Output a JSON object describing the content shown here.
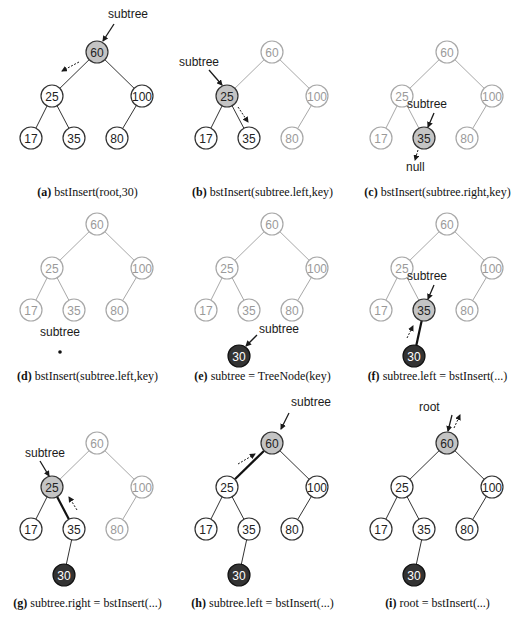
{
  "figure": {
    "colors": {
      "edge_active": "#333333",
      "edge_faded": "#a8a8a8",
      "node_fill": "#ffffff",
      "node_stroke": "#333333",
      "node_stroke_faded": "#a8a8a8",
      "text_faded": "#9a9a9a",
      "highlight_fill": "#c4c4c4",
      "new_node_fill": "#333333",
      "new_node_text": "#ffffff",
      "arrow": "#1a1a1a"
    },
    "tree": {
      "nodes": [
        {
          "id": "n60",
          "key": "60",
          "x": 45,
          "y": 52
        },
        {
          "id": "n25",
          "key": "25",
          "x": 0,
          "y": 96
        },
        {
          "id": "n100",
          "key": "100",
          "x": 90,
          "y": 96
        },
        {
          "id": "n17",
          "key": "17",
          "x": -21,
          "y": 138
        },
        {
          "id": "n35",
          "key": "35",
          "x": 22,
          "y": 138
        },
        {
          "id": "n80",
          "key": "80",
          "x": 65,
          "y": 138
        },
        {
          "id": "n30",
          "key": "30",
          "x": 12,
          "y": 184
        }
      ],
      "edges": [
        [
          "n60",
          "n25"
        ],
        [
          "n60",
          "n100"
        ],
        [
          "n25",
          "n17"
        ],
        [
          "n25",
          "n35"
        ],
        [
          "n100",
          "n80"
        ],
        [
          "n35",
          "n30"
        ]
      ]
    },
    "panels": [
      {
        "id": "a",
        "letter": "(a)",
        "caption": "bstInsert(root,30)",
        "ox": 52,
        "oy": 0,
        "capY": 185,
        "faded": [],
        "highlight": [
          "n60"
        ],
        "dark": [],
        "hidden": [
          "n30"
        ],
        "boldEdges": [],
        "labels": [
          {
            "text": "subtree",
            "x": 56,
            "y": 18
          }
        ],
        "arrows": [
          {
            "x1": 62,
            "y1": 24,
            "x2": 51,
            "y2": 41,
            "dashed": false
          },
          {
            "x1": 27,
            "y1": 62,
            "x2": 10,
            "y2": 71,
            "dashed": true
          }
        ]
      },
      {
        "id": "b",
        "letter": "(b)",
        "caption": "bstInsert(subtree.left,key)",
        "ox": 227,
        "oy": 0,
        "capY": 185,
        "faded": [
          "n60",
          "n100",
          "n80"
        ],
        "highlight": [
          "n25"
        ],
        "dark": [],
        "hidden": [
          "n30"
        ],
        "boldEdges": [],
        "labels": [
          {
            "text": "subtree",
            "x": -48,
            "y": 66
          }
        ],
        "arrows": [
          {
            "x1": -18,
            "y1": 70,
            "x2": -5,
            "y2": 85,
            "dashed": false
          },
          {
            "x1": 11,
            "y1": 107,
            "x2": 21,
            "y2": 122,
            "dashed": true
          }
        ]
      },
      {
        "id": "c",
        "letter": "(c)",
        "caption": "bstInsert(subtree.right,key)",
        "ox": 402,
        "oy": 0,
        "capY": 185,
        "faded": [
          "n60",
          "n25",
          "n100",
          "n17",
          "n80"
        ],
        "highlight": [
          "n35"
        ],
        "dark": [],
        "hidden": [
          "n30"
        ],
        "boldEdges": [],
        "labels": [
          {
            "text": "subtree",
            "x": 5,
            "y": 108
          },
          {
            "text": "null",
            "x": 4,
            "y": 171
          }
        ],
        "arrows": [
          {
            "x1": 32,
            "y1": 113,
            "x2": 26,
            "y2": 127,
            "dashed": false
          },
          {
            "x1": 16,
            "y1": 150,
            "x2": 13,
            "y2": 160,
            "dashed": true
          }
        ]
      },
      {
        "id": "d",
        "letter": "(d)",
        "caption": "bstInsert(subtree.left,key)",
        "ox": 52,
        "oy": 172,
        "capY": 369,
        "faded": [
          "n60",
          "n25",
          "n100",
          "n17",
          "n35",
          "n80"
        ],
        "highlight": [],
        "dark": [],
        "hidden": [
          "n30"
        ],
        "boldEdges": [],
        "labels": [
          {
            "text": "subtree",
            "x": -12,
            "y": 164
          }
        ],
        "dots": [
          {
            "x": 8,
            "y": 180
          }
        ],
        "arrows": []
      },
      {
        "id": "e",
        "letter": "(e)",
        "caption": "subtree = TreeNode(key)",
        "ox": 227,
        "oy": 172,
        "capY": 369,
        "faded": [
          "n60",
          "n25",
          "n100",
          "n17",
          "n35",
          "n80"
        ],
        "highlight": [],
        "dark": [
          "n30"
        ],
        "hidden": [],
        "hideEdges": [
          [
            "n35",
            "n30"
          ]
        ],
        "boldEdges": [],
        "labels": [
          {
            "text": "subtree",
            "x": 32,
            "y": 161
          }
        ],
        "arrows": [
          {
            "x1": 30,
            "y1": 163,
            "x2": 19,
            "y2": 174,
            "dashed": false
          }
        ]
      },
      {
        "id": "f",
        "letter": "(f)",
        "caption": "subtree.left = bstInsert(...)",
        "ox": 402,
        "oy": 172,
        "capY": 369,
        "faded": [
          "n60",
          "n25",
          "n100",
          "n17",
          "n80"
        ],
        "highlight": [
          "n35"
        ],
        "dark": [
          "n30"
        ],
        "hidden": [],
        "boldEdges": [
          [
            "n35",
            "n30"
          ]
        ],
        "labels": [
          {
            "text": "subtree",
            "x": 5,
            "y": 108
          }
        ],
        "arrows": [
          {
            "x1": 32,
            "y1": 113,
            "x2": 26,
            "y2": 127,
            "dashed": false
          },
          {
            "x1": 5,
            "y1": 166,
            "x2": 11,
            "y2": 154,
            "dashed": true
          }
        ]
      },
      {
        "id": "g",
        "letter": "(g)",
        "caption": "subtree.right = bstInsert(...)",
        "ox": 52,
        "oy": 391,
        "capY": 596,
        "faded": [
          "n60",
          "n100",
          "n80"
        ],
        "highlight": [
          "n25"
        ],
        "dark": [
          "n30"
        ],
        "hidden": [],
        "boldEdges": [
          [
            "n25",
            "n35"
          ]
        ],
        "labels": [
          {
            "text": "subtree",
            "x": -27,
            "y": 66
          }
        ],
        "arrows": [
          {
            "x1": -12,
            "y1": 70,
            "x2": -3,
            "y2": 85,
            "dashed": false
          },
          {
            "x1": 25,
            "y1": 119,
            "x2": 17,
            "y2": 106,
            "dashed": true
          }
        ]
      },
      {
        "id": "h",
        "letter": "(h)",
        "caption": "subtree.left = bstInsert(...)",
        "ox": 227,
        "oy": 391,
        "capY": 596,
        "faded": [],
        "highlight": [
          "n60"
        ],
        "dark": [
          "n30"
        ],
        "hidden": [],
        "boldEdges": [
          [
            "n60",
            "n25"
          ]
        ],
        "labels": [
          {
            "text": "subtree",
            "x": 64,
            "y": 15
          }
        ],
        "arrows": [
          {
            "x1": 62,
            "y1": 22,
            "x2": 54,
            "y2": 38,
            "dashed": false
          },
          {
            "x1": 11,
            "y1": 73,
            "x2": 28,
            "y2": 63,
            "dashed": true
          }
        ]
      },
      {
        "id": "i",
        "letter": "(i)",
        "caption": "root = bstInsert(...)",
        "ox": 402,
        "oy": 391,
        "capY": 596,
        "faded": [],
        "highlight": [
          "n60"
        ],
        "dark": [
          "n30"
        ],
        "hidden": [],
        "boldEdges": [],
        "labels": [
          {
            "text": "root",
            "x": 17,
            "y": 20
          }
        ],
        "arrows": [
          {
            "x1": 50,
            "y1": 24,
            "x2": 46,
            "y2": 40,
            "dashed": false
          },
          {
            "x1": 52,
            "y1": 37,
            "x2": 58,
            "y2": 24,
            "dashed": true
          }
        ]
      }
    ]
  }
}
